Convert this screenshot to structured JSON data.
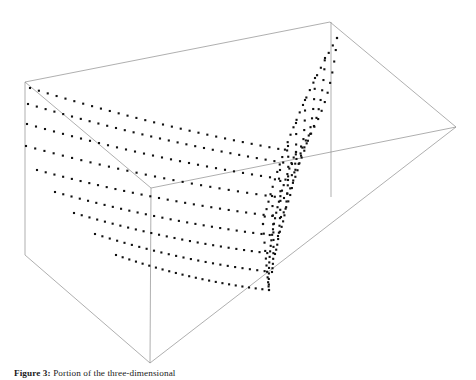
{
  "figure": {
    "caption_label": "Figure 3:",
    "caption_text": "Portion of the three-dimensional",
    "alt_title": "3D dotted mesh surface plot inside a wireframe bounding box"
  },
  "style": {
    "background_color": "#ffffff",
    "frame_line_color": "#8c8c8c",
    "frame_line_width": 0.7,
    "marker_color": "#111111",
    "marker_size_px": 2.1,
    "marker_shape": "square"
  },
  "chart_data": {
    "type": "scatter",
    "title": "",
    "subtitle": "",
    "xlabel": "",
    "ylabel": "",
    "zlabel": "",
    "grid": false,
    "legend": null,
    "projection": "3d-wireframe-box",
    "axis_ticks": [],
    "tick_labels": [],
    "box_frame": {
      "vertices": {
        "back_top_left": [
          25,
          82
        ],
        "back_top_apex": [
          330,
          22
        ],
        "right_top": [
          456,
          127
        ],
        "inner_top": [
          151,
          188
        ],
        "back_bottom_left": [
          25,
          255
        ],
        "front_bottom": [
          150,
          363
        ],
        "right_vertical_top": [
          331,
          22
        ],
        "right_vertical_bottom": [
          331,
          197
        ]
      },
      "edges": [
        [
          "back_top_left",
          "back_top_apex"
        ],
        [
          "back_top_apex",
          "right_top"
        ],
        [
          "back_top_left",
          "inner_top"
        ],
        [
          "inner_top",
          "right_top"
        ],
        [
          "back_top_left",
          "back_bottom_left"
        ],
        [
          "back_bottom_left",
          "front_bottom"
        ],
        [
          "front_bottom",
          "right_top"
        ],
        [
          "inner_top",
          "front_bottom"
        ],
        [
          "right_vertical_top",
          "right_vertical_bottom"
        ]
      ]
    },
    "series": [
      {
        "name": "curve-1",
        "n_points": 44,
        "start_2d": [
          30,
          88
        ],
        "flat_end_2d": [
          296,
          152
        ],
        "tip_2d": [
          337,
          38
        ],
        "rise_control_2d": [
          330,
          118
        ]
      },
      {
        "name": "curve-2",
        "n_points": 44,
        "start_2d": [
          28,
          104
        ],
        "flat_end_2d": [
          292,
          164
        ],
        "tip_2d": [
          325,
          58
        ],
        "rise_control_2d": [
          322,
          133
        ]
      },
      {
        "name": "curve-3",
        "n_points": 43,
        "start_2d": [
          27,
          124
        ],
        "flat_end_2d": [
          288,
          180
        ],
        "tip_2d": [
          315,
          78
        ],
        "rise_control_2d": [
          314,
          150
        ]
      },
      {
        "name": "curve-4",
        "n_points": 42,
        "start_2d": [
          26,
          146
        ],
        "flat_end_2d": [
          284,
          198
        ],
        "tip_2d": [
          305,
          100
        ],
        "rise_control_2d": [
          306,
          170
        ]
      },
      {
        "name": "curve-5",
        "n_points": 41,
        "start_2d": [
          37,
          170
        ],
        "flat_end_2d": [
          281,
          217
        ],
        "tip_2d": [
          296,
          123
        ],
        "rise_control_2d": [
          298,
          191
        ]
      },
      {
        "name": "curve-6",
        "n_points": 40,
        "start_2d": [
          55,
          192
        ],
        "flat_end_2d": [
          278,
          236
        ],
        "tip_2d": [
          288,
          146
        ],
        "rise_control_2d": [
          290,
          212
        ]
      },
      {
        "name": "curve-7",
        "n_points": 38,
        "start_2d": [
          74,
          213
        ],
        "flat_end_2d": [
          275,
          254
        ],
        "tip_2d": [
          280,
          170
        ],
        "rise_control_2d": [
          282,
          232
        ]
      },
      {
        "name": "curve-8",
        "n_points": 36,
        "start_2d": [
          95,
          234
        ],
        "flat_end_2d": [
          272,
          272
        ],
        "tip_2d": [
          272,
          196
        ],
        "rise_control_2d": [
          275,
          253
        ]
      },
      {
        "name": "curve-9",
        "n_points": 34,
        "start_2d": [
          116,
          255
        ],
        "flat_end_2d": [
          269,
          290
        ],
        "tip_2d": [
          263,
          224
        ],
        "rise_control_2d": [
          267,
          274
        ]
      }
    ],
    "cross_curves": [
      {
        "name": "ridge-1",
        "from_2d": [
          337,
          38
        ],
        "to_2d": [
          263,
          224
        ]
      },
      {
        "name": "ridge-2",
        "from_2d": [
          296,
          152
        ],
        "to_2d": [
          269,
          290
        ]
      }
    ]
  }
}
